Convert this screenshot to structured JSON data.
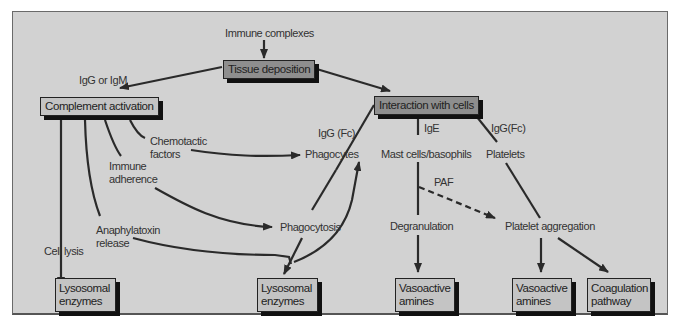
{
  "diagram": {
    "colors": {
      "background": "#d2d2d2",
      "box_light": "#c4c4c4",
      "box_dark": "#8e8e8e",
      "line": "#2a2a2a"
    },
    "nodes": {
      "immune_complexes": "Immune complexes",
      "tissue_deposition": "Tissue deposition",
      "complement_activation": "Complement activation",
      "interaction_with_cells": "Interaction with cells",
      "chemotactic_factors_1": "Chemotactic",
      "chemotactic_factors_2": "factors",
      "immune_adherence_1": "Immune",
      "immune_adherence_2": "adherence",
      "anaphylatoxin_release_1": "Anaphylatoxin",
      "anaphylatoxin_release_2": "release",
      "cell_lysis": "Cell lysis",
      "phagocytes": "Phagocytes",
      "phagocytosis": "Phagocytosis",
      "mast_cells_basophils": "Mast cells/basophils",
      "platelets": "Platelets",
      "degranulation": "Degranulation",
      "platelet_aggregation": "Platelet aggregation",
      "lysosomal_enzymes_left_1": "Lysosomal",
      "lysosomal_enzymes_left_2": "enzymes",
      "lysosomal_enzymes_mid_1": "Lysosomal",
      "lysosomal_enzymes_mid_2": "enzymes",
      "vasoactive_amines_1_a": "Vasoactive",
      "vasoactive_amines_1_b": "amines",
      "vasoactive_amines_2_a": "Vasoactive",
      "vasoactive_amines_2_b": "amines",
      "coagulation_pathway_1": "Coagulation",
      "coagulation_pathway_2": "pathway"
    },
    "edge_labels": {
      "igg_or_igm": "IgG or IgM",
      "igg_fc_left": "IgG (Fc)",
      "ige": "IgE",
      "igg_fc_right": "IgG(Fc)",
      "paf": "PAF"
    }
  }
}
